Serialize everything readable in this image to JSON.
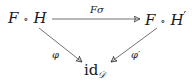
{
  "diagram": {
    "type": "commutative-diagram",
    "nodes": [
      {
        "id": "FH",
        "f": "F",
        "op": "∘",
        "g": "H",
        "prime": ""
      },
      {
        "id": "FHp",
        "f": "F",
        "op": "∘",
        "g": "H",
        "prime": "′"
      },
      {
        "id": "id",
        "base": "id",
        "sub": "𝒟"
      }
    ],
    "edges": [
      {
        "from": "FH",
        "to": "FHp",
        "label": "Fσ"
      },
      {
        "from": "FH",
        "to": "id",
        "label": "φ"
      },
      {
        "from": "FHp",
        "to": "id",
        "label": "φ′"
      }
    ],
    "colors": {
      "stroke": "#333333",
      "text": "#1a1a1a"
    }
  }
}
